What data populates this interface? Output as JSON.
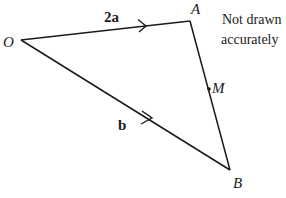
{
  "diagram": {
    "points": {
      "O": {
        "label": "O",
        "x": 21,
        "y": 40
      },
      "A": {
        "label": "A",
        "x": 190,
        "y": 21
      },
      "B": {
        "label": "B",
        "x": 230,
        "y": 170
      },
      "M": {
        "label": "M",
        "x": 209,
        "y": 89
      }
    },
    "vectors": {
      "OA": {
        "label": "2a"
      },
      "OB": {
        "label": "b"
      }
    },
    "note_line1": "Not drawn",
    "note_line2": "accurately",
    "line_color": "#1a1a1a"
  }
}
